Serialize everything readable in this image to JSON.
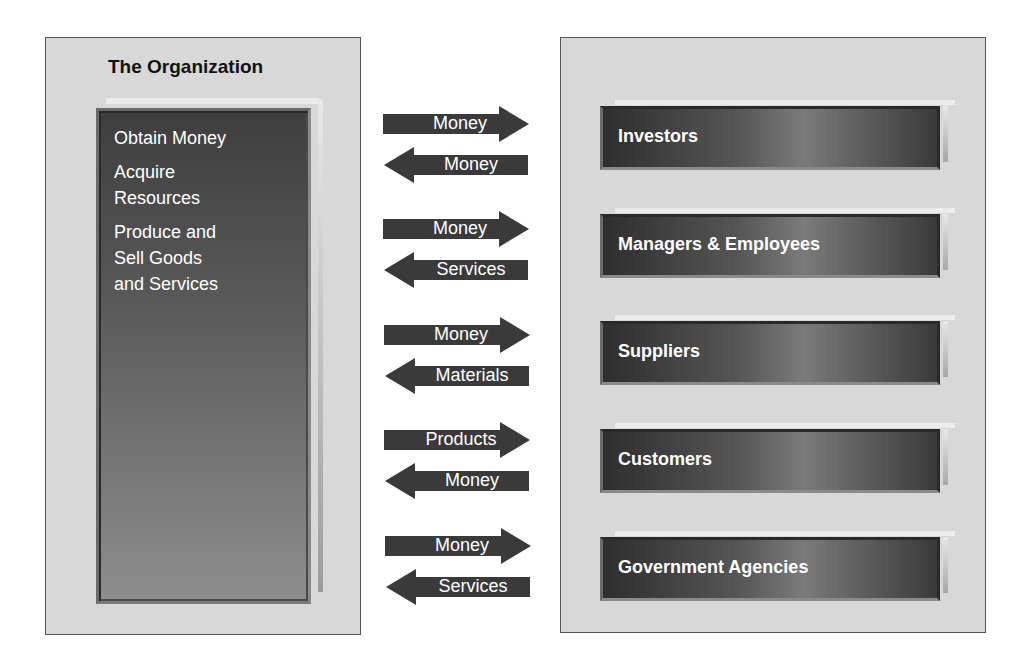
{
  "organization": {
    "title": "The Organization",
    "activities": [
      "Obtain Money",
      "Acquire\nResources",
      "Produce and\nSell Goods\nand Services"
    ]
  },
  "flows": [
    {
      "stakeholder": "Investors",
      "out": "Money",
      "in": "Money"
    },
    {
      "stakeholder": "Managers & Employees",
      "out": "Money",
      "in": "Services"
    },
    {
      "stakeholder": "Suppliers",
      "out": "Money",
      "in": "Materials"
    },
    {
      "stakeholder": "Customers",
      "out": "Products",
      "in": "Money"
    },
    {
      "stakeholder": "Government Agencies",
      "out": "Money",
      "in": "Services"
    }
  ],
  "colors": {
    "panel_bg": "#d8d8d8",
    "box_dark": "#3e3e3e",
    "arrow": "#3a3a3a",
    "text_light": "#ffffff"
  }
}
